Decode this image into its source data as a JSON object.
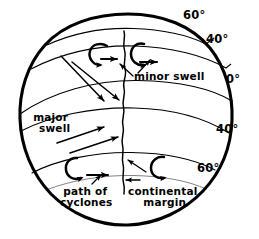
{
  "figure": {
    "stroke_color": "#000000",
    "background_color": "#ffffff",
    "width": 259,
    "height": 239
  },
  "latitude_labels": [
    {
      "id": "north-60",
      "text": "60°",
      "x": 183,
      "y": 14
    },
    {
      "id": "north-40",
      "text": "40°",
      "x": 207,
      "y": 38
    },
    {
      "id": "equator-0",
      "text": "0°",
      "x": 224,
      "y": 79
    },
    {
      "id": "south-40",
      "text": "40°",
      "x": 215,
      "y": 128
    },
    {
      "id": "south-60",
      "text": "60°",
      "x": 196,
      "y": 167
    }
  ],
  "annotations": [
    {
      "id": "minor-swell",
      "text": "minor swell",
      "lines": [
        "minor swell"
      ],
      "x": 132,
      "y": 76
    },
    {
      "id": "major-swell",
      "text": "major swell",
      "lines": [
        "major",
        "swell"
      ],
      "x": 31,
      "y": 117
    },
    {
      "id": "path-of-cyclones",
      "text": "path of cyclones",
      "lines": [
        "path of",
        "cyclones"
      ],
      "x": 57,
      "y": 189
    },
    {
      "id": "continental-margin",
      "text": "continental margin",
      "lines": [
        "continental",
        "margin"
      ],
      "x": 127,
      "y": 189
    }
  ],
  "features": {
    "globe_outline": "hand-drawn circular globe outline",
    "latitude_lines": 5,
    "continental_margin_line": "wavy vertical meridian line",
    "cyclone_spirals": 4,
    "swell_arrows": 4
  }
}
